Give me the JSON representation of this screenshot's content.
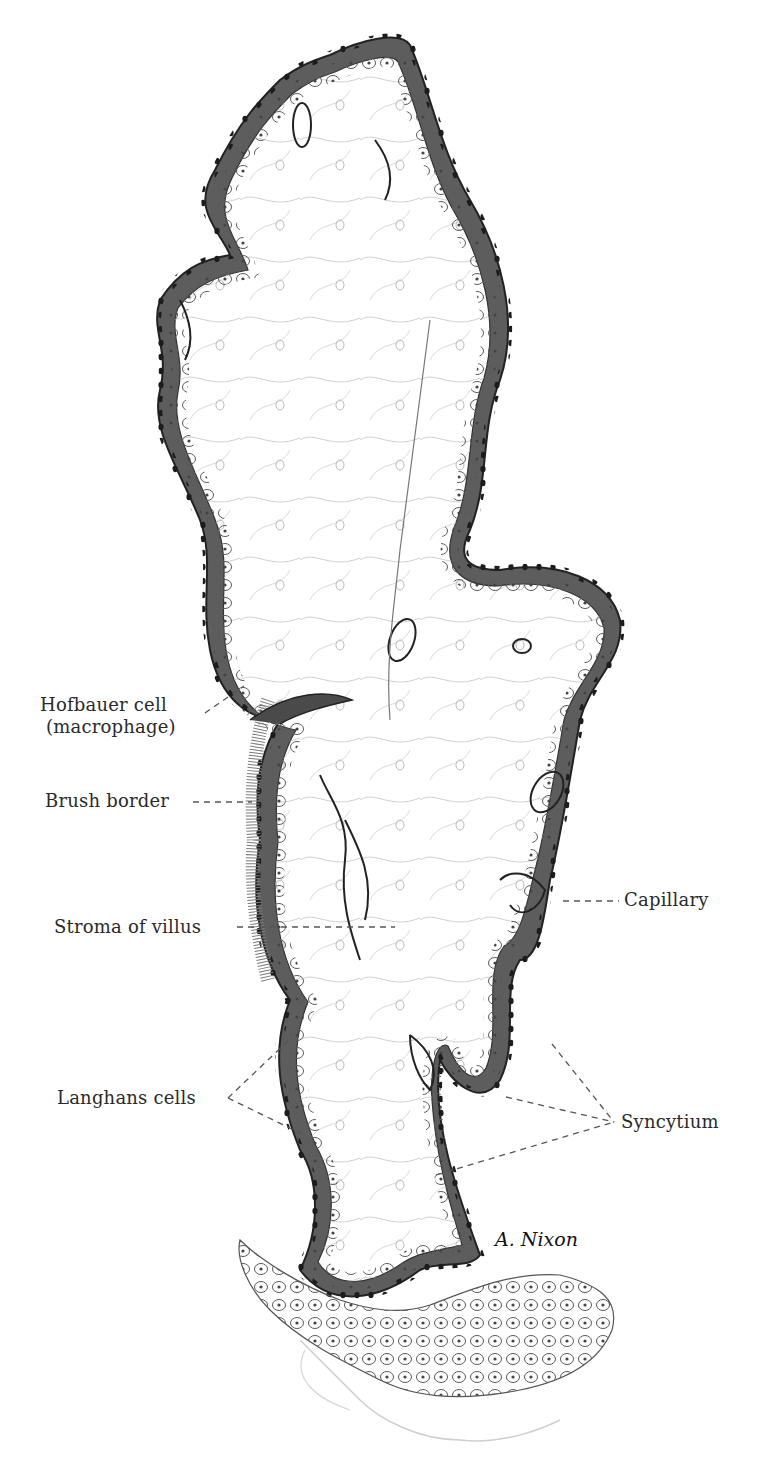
{
  "figure": {
    "background": "#ffffff",
    "colors": {
      "syncytium": "#3a3a3a",
      "syncytium_shade": "#6e6e6e",
      "nuclei": "#1e1e1e",
      "cell_outline": "#4a4a4a",
      "stroma_lines": "#9a9a9a",
      "leader_line": "#555555",
      "label_text": "#2a2a2a"
    }
  },
  "labels": [
    {
      "id": "hofbauer",
      "line1": "Hofbauer cell",
      "line2": "(macrophage)"
    },
    {
      "id": "brush_border",
      "text": "Brush border"
    },
    {
      "id": "stroma",
      "text": "Stroma of villus"
    },
    {
      "id": "capillary",
      "text": "Capillary"
    },
    {
      "id": "langhans",
      "text": "Langhans cells"
    },
    {
      "id": "syncytium",
      "text": "Syncytium"
    }
  ],
  "signature": {
    "text": "A. Nixon"
  }
}
